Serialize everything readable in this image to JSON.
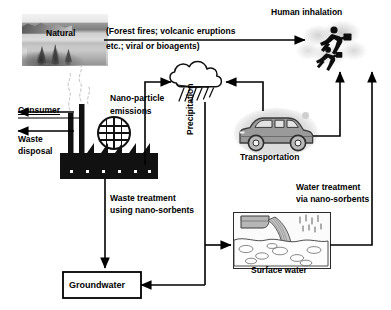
{
  "figure": {
    "type": "flow-diagram"
  },
  "nodes": {
    "natural": {
      "label": "Natural",
      "icon": "landscape-photo-icon"
    },
    "natural_sources_note": {
      "line1": "(Forest fires; volcanic eruptions",
      "line2": "etc.; viral or bioagents)"
    },
    "human_inhalation": {
      "label": "Human inhalation",
      "icon": "running-people-icon"
    },
    "consumer": {
      "label": "Consumer"
    },
    "waste_disposal": {
      "line1": "Waste",
      "line2": "disposal"
    },
    "factory": {
      "icon": "factory-smokestacks-icon"
    },
    "globe": {
      "icon": "globe-icon"
    },
    "nano_particle_emissions": {
      "line1": "Nano-particle",
      "line2": "emissions"
    },
    "cloud": {
      "icon": "rain-cloud-icon"
    },
    "precipitation": {
      "label": "Precipitation"
    },
    "transportation": {
      "label": "Transportation",
      "icon": "minivan-icon"
    },
    "waste_treatment": {
      "line1": "Waste treatment",
      "line2": "using nano-sorbents"
    },
    "water_treatment": {
      "line1": "Water treatment",
      "line2": "via nano-sorbents"
    },
    "surface_water": {
      "label": "Surface water",
      "icon": "outfall-pipe-water-icon"
    },
    "groundwater": {
      "label": "Groundwater"
    }
  },
  "colors": {
    "stroke": "#000000",
    "text": "#000000",
    "background": "#ffffff",
    "car_body": "#9a9a9a",
    "blob_gray": "#d4d4d4"
  }
}
